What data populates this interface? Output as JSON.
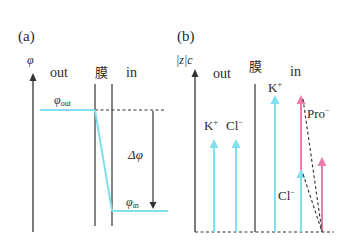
{
  "colors": {
    "cyan": "#7fe0ef",
    "pink": "#f07aaa",
    "ink": "#333333"
  },
  "panel_a": {
    "label": "(a)",
    "y_axis_label": "φ",
    "region_out": "out",
    "region_membrane": "膜",
    "region_in": "in",
    "phi_out": {
      "base": "φ",
      "sub": "out"
    },
    "phi_in": {
      "base": "φ",
      "sub": "in"
    },
    "delta_phi": "Δφ"
  },
  "panel_b": {
    "label": "(b)",
    "y_axis_label": "|z|c",
    "region_out": "out",
    "region_membrane": "膜",
    "region_in": "in",
    "out_ions": [
      {
        "name": "K",
        "charge": "+",
        "color": "cyan"
      },
      {
        "name": "Cl",
        "charge": "−",
        "color": "cyan"
      }
    ],
    "in_ions": [
      {
        "name": "K",
        "charge": "+",
        "color": "cyan"
      },
      {
        "name": "Pro",
        "charge": "−",
        "color": "pink"
      },
      {
        "name": "Cl",
        "charge": "−",
        "color": "cyan"
      }
    ]
  }
}
